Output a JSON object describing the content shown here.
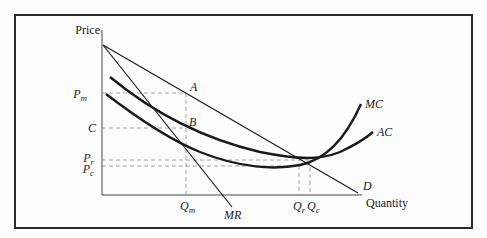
{
  "diagram": {
    "axes": {
      "y_label": "Price",
      "x_label": "Quantity"
    },
    "price_labels": {
      "pm": {
        "main": "P",
        "sub": "m"
      },
      "c": "C",
      "pr": {
        "main": "P",
        "sub": "r"
      },
      "pc": {
        "main": "P",
        "sub": "c"
      }
    },
    "quantity_labels": {
      "qm": {
        "main": "Q",
        "sub": "m"
      },
      "qr": {
        "main": "Q",
        "sub": "r"
      },
      "qc": {
        "main": "Q",
        "sub": "c"
      }
    },
    "points": {
      "a": "A",
      "b": "B"
    },
    "curves": {
      "mc": "MC",
      "ac": "AC",
      "d": "D",
      "mr": "MR"
    },
    "colors": {
      "line": "#1a1a1a",
      "dashed": "#8a8a8a",
      "frame": "#2a2a2a"
    }
  }
}
